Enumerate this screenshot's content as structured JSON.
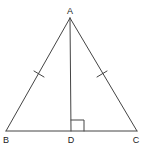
{
  "figure": {
    "type": "isosceles-triangle-with-altitude",
    "stroke_color": "#444444",
    "label_color": "#222222",
    "background": "#ffffff"
  },
  "points": {
    "A": {
      "label": "A",
      "x": 70,
      "y": 18
    },
    "B": {
      "label": "B",
      "x": 6,
      "y": 131
    },
    "C": {
      "label": "C",
      "x": 137,
      "y": 131
    },
    "D": {
      "label": "D",
      "x": 71,
      "y": 131
    }
  },
  "segments": [
    {
      "name": "AB",
      "from": "A",
      "to": "B",
      "tick_marks": 1
    },
    {
      "name": "AC",
      "from": "A",
      "to": "C",
      "tick_marks": 1
    },
    {
      "name": "BC",
      "from": "B",
      "to": "C",
      "tick_marks": 0
    },
    {
      "name": "AD",
      "from": "A",
      "to": "D",
      "tick_marks": 0
    }
  ],
  "annotations": {
    "right_angle_at": "D",
    "equal_sides": [
      "AB",
      "AC"
    ]
  },
  "labels": {
    "A": "A",
    "B": "B",
    "C": "C",
    "D": "D"
  }
}
